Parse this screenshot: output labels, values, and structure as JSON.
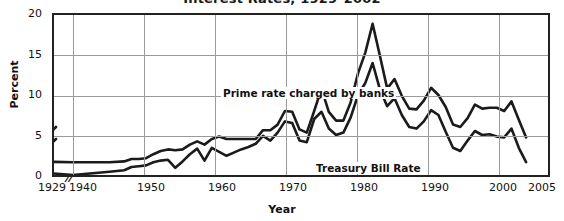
{
  "chart_data": {
    "type": "line",
    "title": "Interest Rates, 1929–2002",
    "xlabel": "Year",
    "ylabel": "Percent",
    "ylim": [
      0,
      20
    ],
    "yticks": [
      0,
      5,
      10,
      15,
      20
    ],
    "xticks": [
      1929,
      1940,
      1950,
      1960,
      1970,
      1980,
      1990,
      2000,
      2005
    ],
    "xlim": [
      1929,
      2005
    ],
    "axis_break": "1929–1940 axis break (//)",
    "grid": true,
    "legend_position": "inline-annotations",
    "annotations": [
      {
        "text": "Prime rate charged by banks",
        "x": 1962,
        "y": 12.2
      },
      {
        "text": "Treasury Bill Rate",
        "x": 1974,
        "y": 3.1
      }
    ],
    "x": [
      1929,
      1933,
      1940,
      1945,
      1947,
      1948,
      1949,
      1950,
      1951,
      1952,
      1953,
      1954,
      1955,
      1956,
      1957,
      1958,
      1959,
      1960,
      1961,
      1962,
      1963,
      1964,
      1965,
      1966,
      1967,
      1968,
      1969,
      1970,
      1971,
      1972,
      1973,
      1974,
      1975,
      1976,
      1977,
      1978,
      1979,
      1980,
      1981,
      1982,
      1983,
      1984,
      1985,
      1986,
      1987,
      1988,
      1989,
      1990,
      1991,
      1992,
      1993,
      1994,
      1995,
      1996,
      1997,
      1998,
      1999,
      2000,
      2001,
      2002
    ],
    "series": [
      {
        "name": "Prime rate charged by banks",
        "values": [
          6.0,
          1.7,
          1.6,
          1.6,
          1.7,
          2.0,
          2.0,
          2.1,
          2.6,
          3.0,
          3.2,
          3.1,
          3.2,
          3.8,
          4.2,
          3.8,
          4.5,
          4.8,
          4.5,
          4.5,
          4.5,
          4.5,
          4.5,
          5.6,
          5.6,
          6.3,
          8.0,
          7.9,
          5.7,
          5.3,
          8.0,
          10.8,
          7.9,
          6.8,
          6.8,
          9.1,
          12.7,
          15.3,
          18.9,
          14.9,
          10.8,
          12.0,
          9.9,
          8.3,
          8.2,
          9.3,
          10.9,
          10.0,
          8.5,
          6.3,
          6.0,
          7.1,
          8.8,
          8.3,
          8.4,
          8.4,
          8.0,
          9.2,
          6.9,
          4.7
        ]
      },
      {
        "name": "Treasury Bill Rate",
        "values": [
          4.5,
          0.5,
          0.0,
          0.4,
          0.6,
          1.0,
          1.1,
          1.2,
          1.6,
          1.8,
          1.9,
          0.9,
          1.7,
          2.6,
          3.3,
          1.8,
          3.4,
          2.9,
          2.4,
          2.8,
          3.2,
          3.5,
          3.9,
          4.9,
          4.3,
          5.3,
          6.7,
          6.5,
          4.3,
          4.1,
          7.0,
          7.9,
          5.8,
          5.0,
          5.3,
          7.2,
          10.0,
          11.5,
          14.0,
          10.7,
          8.6,
          9.6,
          7.5,
          6.0,
          5.8,
          6.7,
          8.1,
          7.5,
          5.4,
          3.4,
          3.0,
          4.3,
          5.5,
          5.0,
          5.1,
          4.8,
          4.7,
          5.8,
          3.4,
          1.6
        ]
      }
    ]
  },
  "yticks_labels": [
    "20",
    "15",
    "10",
    "5",
    "0"
  ],
  "xticks_labels": [
    "1929",
    "1940",
    "1950",
    "1960",
    "1970",
    "1980",
    "1990",
    "2000",
    "2005"
  ],
  "break_marker": "//"
}
